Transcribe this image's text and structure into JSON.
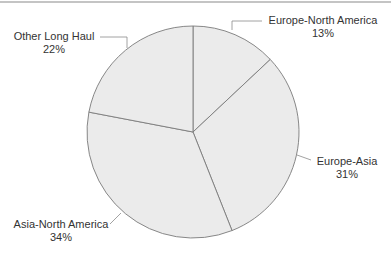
{
  "chart_data": {
    "type": "pie",
    "title": "",
    "categories": [
      "Europe-North America",
      "Europe-Asia",
      "Asia-North America",
      "Other Long Haul"
    ],
    "values": [
      13,
      31,
      34,
      22
    ],
    "unit": "%",
    "start_angle_deg": 0,
    "direction": "clockwise",
    "legend": "none (direct labels with leader lines)",
    "slices": [
      {
        "label": "Europe-North America",
        "value": 13,
        "value_label": "13%"
      },
      {
        "label": "Europe-Asia",
        "value": 31,
        "value_label": "31%"
      },
      {
        "label": "Asia-North America",
        "value": 34,
        "value_label": "34%"
      },
      {
        "label": "Other Long Haul",
        "value": 22,
        "value_label": "22%"
      }
    ]
  },
  "colors": {
    "slice_fill": "#ebebeb",
    "slice_stroke": "#7a7a7a",
    "leader_line": "#8a8a8a",
    "text": "#333333",
    "top_rule": "#c4c4c4"
  },
  "labels": {
    "europe_north_america": {
      "name": "Europe-North America",
      "pct": "13%"
    },
    "europe_asia": {
      "name": "Europe-Asia",
      "pct": "31%"
    },
    "asia_north_america": {
      "name": "Asia-North America",
      "pct": "34%"
    },
    "other_long_haul": {
      "name": "Other Long Haul",
      "pct": "22%"
    }
  }
}
